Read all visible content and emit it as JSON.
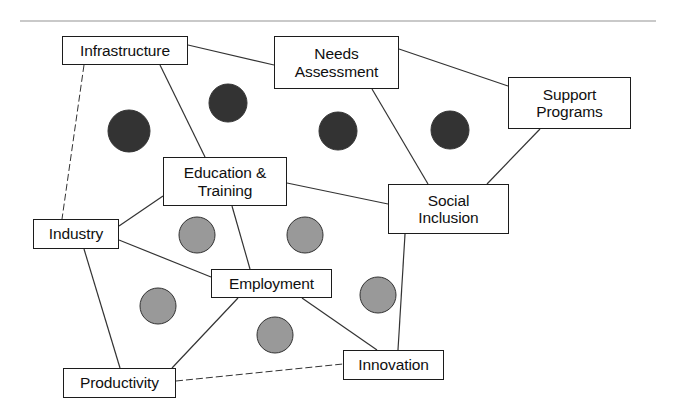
{
  "diagram": {
    "type": "node-link-network",
    "canvas": {
      "width": 674,
      "height": 416
    },
    "colors": {
      "background": "#ffffff",
      "box_border": "#1c1c1c",
      "box_fill": "#ffffff",
      "label_text": "#101010",
      "edge_line": "#333333",
      "dark_node": "#333333",
      "light_node": "#999999",
      "node_outline": "#333333",
      "top_rule": "#c9c9c9"
    },
    "top_rule": {
      "x1": 20,
      "y1": 20,
      "x2": 656,
      "y2": 22
    },
    "nodes": [
      {
        "id": "infrastructure",
        "label": "Infrastructure",
        "x": 62,
        "y": 36,
        "w": 126,
        "h": 29
      },
      {
        "id": "needs",
        "label": "Needs\nAssessment",
        "x": 274,
        "y": 36,
        "w": 125,
        "h": 53
      },
      {
        "id": "support",
        "label": "Support\nProgrames",
        "x": 508,
        "y": 77,
        "w": 123,
        "h": 52
      },
      {
        "id": "education",
        "label": "Education &\nTraining",
        "x": 163,
        "y": 157,
        "w": 124,
        "h": 49
      },
      {
        "id": "social",
        "label": "Social\nInclusion",
        "x": 388,
        "y": 184,
        "w": 121,
        "h": 50
      },
      {
        "id": "industry",
        "label": "Industry",
        "x": 33,
        "y": 219,
        "w": 86,
        "h": 30
      },
      {
        "id": "employment",
        "label": "Employment",
        "x": 211,
        "y": 269,
        "w": 121,
        "h": 29
      },
      {
        "id": "productivity",
        "label": "Productivity",
        "x": 63,
        "y": 368,
        "w": 113,
        "h": 30
      },
      {
        "id": "innovation",
        "label": "Innovation",
        "x": 343,
        "y": 350,
        "w": 101,
        "h": 30
      }
    ],
    "node_label_overrides": [
      {
        "id": "support",
        "label": "Support\nPrograms"
      }
    ],
    "circles": [
      {
        "id": "dark-circle-1",
        "group": "dark",
        "cx": 129,
        "cy": 131,
        "r": 21
      },
      {
        "id": "dark-circle-2",
        "group": "dark",
        "cx": 228,
        "cy": 103,
        "r": 19
      },
      {
        "id": "dark-circle-3",
        "group": "dark",
        "cx": 338,
        "cy": 131,
        "r": 19
      },
      {
        "id": "dark-circle-4",
        "group": "dark",
        "cx": 450,
        "cy": 130,
        "r": 19
      },
      {
        "id": "light-circle-1",
        "group": "light",
        "cx": 197,
        "cy": 235,
        "r": 18
      },
      {
        "id": "light-circle-2",
        "group": "light",
        "cx": 305,
        "cy": 235,
        "r": 18
      },
      {
        "id": "light-circle-3",
        "group": "light",
        "cx": 158,
        "cy": 306,
        "r": 18
      },
      {
        "id": "light-circle-4",
        "group": "light",
        "cx": 378,
        "cy": 295,
        "r": 18
      },
      {
        "id": "light-circle-5",
        "group": "light",
        "cx": 275,
        "cy": 335,
        "r": 18
      }
    ],
    "edges": [
      {
        "id": "e-infra-needs",
        "from": "infrastructure",
        "to": "needs",
        "x1": 188,
        "y1": 45,
        "x2": 274,
        "y2": 65,
        "style": "solid"
      },
      {
        "id": "e-infra-education",
        "from": "infrastructure",
        "to": "education",
        "x1": 160,
        "y1": 65,
        "x2": 205,
        "y2": 157,
        "style": "solid"
      },
      {
        "id": "e-infra-industry",
        "from": "infrastructure",
        "to": "industry",
        "x1": 84,
        "y1": 65,
        "x2": 62,
        "y2": 219,
        "style": "dashed"
      },
      {
        "id": "e-needs-support",
        "from": "needs",
        "to": "support",
        "x1": 399,
        "y1": 49,
        "x2": 508,
        "y2": 86,
        "style": "solid"
      },
      {
        "id": "e-needs-social",
        "from": "needs",
        "to": "social",
        "x1": 372,
        "y1": 89,
        "x2": 428,
        "y2": 184,
        "style": "solid"
      },
      {
        "id": "e-support-social",
        "from": "support",
        "to": "social",
        "x1": 540,
        "y1": 129,
        "x2": 487,
        "y2": 184,
        "style": "solid"
      },
      {
        "id": "e-education-social",
        "from": "education",
        "to": "social",
        "x1": 287,
        "y1": 183,
        "x2": 388,
        "y2": 204,
        "style": "solid"
      },
      {
        "id": "e-education-employ",
        "from": "education",
        "to": "employment",
        "x1": 232,
        "y1": 206,
        "x2": 250,
        "y2": 269,
        "style": "solid"
      },
      {
        "id": "e-education-industry",
        "from": "education",
        "to": "industry",
        "x1": 163,
        "y1": 196,
        "x2": 119,
        "y2": 226,
        "style": "solid"
      },
      {
        "id": "e-industry-employ",
        "from": "industry",
        "to": "employment",
        "x1": 119,
        "y1": 240,
        "x2": 211,
        "y2": 277,
        "style": "solid"
      },
      {
        "id": "e-industry-product",
        "from": "industry",
        "to": "productivity",
        "x1": 84,
        "y1": 249,
        "x2": 120,
        "y2": 368,
        "style": "solid"
      },
      {
        "id": "e-employ-product",
        "from": "employment",
        "to": "productivity",
        "x1": 238,
        "y1": 298,
        "x2": 172,
        "y2": 368,
        "style": "solid"
      },
      {
        "id": "e-employ-innovation",
        "from": "employment",
        "to": "innovation",
        "x1": 302,
        "y1": 298,
        "x2": 377,
        "y2": 350,
        "style": "solid"
      },
      {
        "id": "e-social-innovation",
        "from": "social",
        "to": "innovation",
        "x1": 405,
        "y1": 234,
        "x2": 398,
        "y2": 350,
        "style": "solid"
      },
      {
        "id": "e-product-innovation",
        "from": "productivity",
        "to": "innovation",
        "x1": 176,
        "y1": 381,
        "x2": 343,
        "y2": 364,
        "style": "dashed"
      }
    ]
  }
}
